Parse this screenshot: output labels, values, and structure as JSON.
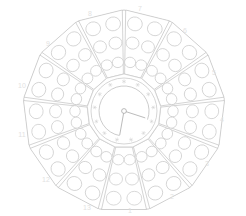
{
  "diagram": {
    "kind": "clock-face-rosette",
    "segment_count": 13,
    "holes_per_segment": 6,
    "line_color": "#c2c2c2",
    "hole_color": "#c9c9c9",
    "label_color": "#e2e2e2",
    "background": "#ffffff"
  },
  "center_dial": {
    "name": "center-dial",
    "radius": 33,
    "cx": 124,
    "cy": 111,
    "inner_arc_radius": 25,
    "pivot_radius": 2.4,
    "tick_glyph": "asterisk",
    "tick_count": 13,
    "hands": [
      {
        "name": "hand-upper-right",
        "angle_deg": 18,
        "length": 22
      },
      {
        "name": "hand-lower",
        "angle_deg": 100,
        "length": 24
      }
    ]
  },
  "segments": [
    {
      "index": 1,
      "label": "1",
      "angle_deg": 90,
      "label_x": 130,
      "label_y": 211
    },
    {
      "index": 2,
      "label": "2",
      "angle_deg": 62.3077,
      "label_x": 172,
      "label_y": 197
    },
    {
      "index": 3,
      "label": "3",
      "angle_deg": 34.6154,
      "label_x": 207,
      "label_y": 164
    },
    {
      "index": 4,
      "label": "4",
      "angle_deg": 6.9231,
      "label_x": 222,
      "label_y": 120
    },
    {
      "index": 5,
      "label": "5",
      "angle_deg": -20.769,
      "label_x": 214,
      "label_y": 73
    },
    {
      "index": 6,
      "label": "6",
      "angle_deg": -48.461,
      "label_x": 185,
      "label_y": 31
    },
    {
      "index": 7,
      "label": "7",
      "angle_deg": -76.153,
      "label_x": 140,
      "label_y": 9
    },
    {
      "index": 8,
      "label": "8",
      "angle_deg": -103.846,
      "label_x": 90,
      "label_y": 14
    },
    {
      "index": 9,
      "label": "9",
      "angle_deg": -131.538,
      "label_x": 48,
      "label_y": 44
    },
    {
      "index": 10,
      "label": "10",
      "angle_deg": -159.23,
      "label_x": 22,
      "label_y": 86
    },
    {
      "index": 11,
      "label": "11",
      "angle_deg": 173.077,
      "label_x": 22,
      "label_y": 135
    },
    {
      "index": 12,
      "label": "12",
      "angle_deg": 145.385,
      "label_x": 46,
      "label_y": 180
    },
    {
      "index": 13,
      "label": "13",
      "angle_deg": 117.692,
      "label_x": 87,
      "label_y": 208
    }
  ]
}
